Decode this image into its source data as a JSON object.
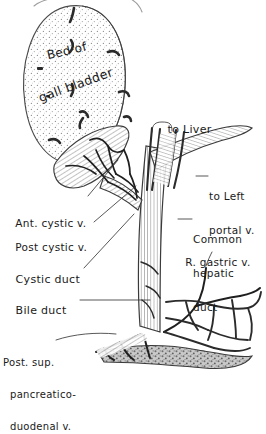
{
  "figure": {
    "kind": "anatomical-line-drawing",
    "style": "pen-and-ink stipple and hatch, handwritten labels",
    "background_color": "#ffffff",
    "ink_color": "#1a1a1a",
    "fill_gray": "#b9b9b9",
    "stipple_gray": "#9a9a9a"
  },
  "labels": {
    "bed_line1": "Bed of",
    "bed_line2": "gall bladder",
    "to_liver": "to Liver",
    "to_left_portal_1": "to Left",
    "to_left_portal_2": "portal v.",
    "common_hepatic_1": "Common",
    "common_hepatic_2": "hepatic",
    "common_hepatic_3": "duct",
    "r_gastric": "R. gastric v.",
    "ant_cystic": "Ant. cystic v.",
    "post_cystic": "Post cystic v.",
    "cystic_duct": "Cystic duct",
    "bile_duct": "Bile duct",
    "pancreatico_1": "Post. sup.",
    "pancreatico_2": "pancreatico-",
    "pancreatico_3": "duodenal v."
  },
  "structures": [
    {
      "name": "gallbladder-bed",
      "note": "large stippled oval, upper left"
    },
    {
      "name": "gallbladder-neck",
      "note": "hatched tapering body, lower right of bed"
    },
    {
      "name": "cystic-duct"
    },
    {
      "name": "common-hepatic-duct"
    },
    {
      "name": "bile-duct"
    },
    {
      "name": "left-portal-vein-branch"
    },
    {
      "name": "right-gastric-vein"
    },
    {
      "name": "posterior-superior-pancreaticoduodenal-vein"
    },
    {
      "name": "anterior-cystic-vein"
    },
    {
      "name": "posterior-cystic-vein"
    },
    {
      "name": "liver-margin-outline",
      "note": "faint curves at top edge"
    }
  ]
}
